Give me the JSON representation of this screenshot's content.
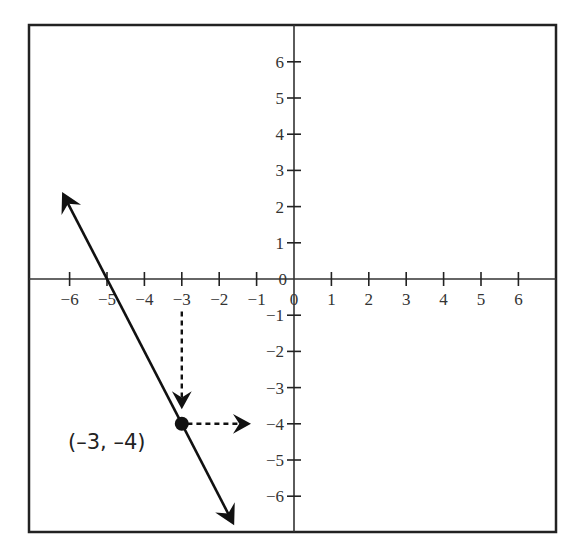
{
  "diagram": {
    "type": "coordinate-plane",
    "x_axis": {
      "ticks": [
        -6,
        -5,
        -4,
        -3,
        -2,
        -1,
        0,
        1,
        2,
        3,
        4,
        5,
        6
      ],
      "labels": [
        "−6",
        "−5",
        "−4",
        "−3",
        "−2",
        "−1",
        "0",
        "1",
        "2",
        "3",
        "4",
        "5",
        "6"
      ],
      "origin_label": "0"
    },
    "y_axis": {
      "ticks": [
        6,
        5,
        4,
        3,
        2,
        1,
        -1,
        -2,
        -3,
        -4,
        -5,
        -6
      ],
      "labels": [
        "6",
        "5",
        "4",
        "3",
        "2",
        "1",
        "−1",
        "−2",
        "−3",
        "−4",
        "−5",
        "−6"
      ],
      "origin_label": "0"
    },
    "line": {
      "description": "line with arrows at both ends, slope -2",
      "from": [
        -6.2,
        2.4
      ],
      "to": [
        -1.6,
        -6.8
      ],
      "passes_through": [
        [
          -5,
          0
        ],
        [
          -3,
          -4
        ]
      ]
    },
    "point": {
      "x": -3,
      "y": -4,
      "label": "(–3, –4)"
    },
    "guides": [
      {
        "style": "dashed-arrow",
        "from": [
          -3,
          -0.9
        ],
        "to": [
          -3,
          -3.6
        ],
        "description": "dashed arrow down from x-axis at -3"
      },
      {
        "style": "dashed-arrow",
        "from": [
          -2.85,
          -4
        ],
        "to": [
          -1.15,
          -4
        ],
        "description": "dashed arrow right toward y-axis at -4"
      }
    ],
    "colors": {
      "ink": "#111111",
      "text": "#333333",
      "background": "#ffffff"
    }
  }
}
